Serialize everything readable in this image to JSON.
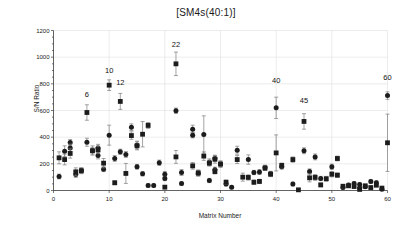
{
  "chart_data": {
    "type": "scatter",
    "title": "[SM4s(40:1)]",
    "xlabel": "Matrix Number",
    "ylabel": "S/N Ratio",
    "xlim": [
      0,
      60
    ],
    "ylim": [
      0,
      1200
    ],
    "xticks": [
      0,
      10,
      20,
      30,
      40,
      50,
      60
    ],
    "yticks": [
      0,
      200,
      400,
      600,
      800,
      1000,
      1200
    ],
    "xtick_labels": [
      "0",
      "10",
      "20",
      "30",
      "40",
      "50",
      "60"
    ],
    "ytick_labels": [
      "0",
      "200",
      "400",
      "600",
      "800",
      "1000",
      "1200"
    ],
    "grid": "both-major",
    "legend": "none",
    "annotations": [
      {
        "text": "6",
        "x": 6,
        "y": 700
      },
      {
        "text": "10",
        "x": 10,
        "y": 880
      },
      {
        "text": "12",
        "x": 12,
        "y": 790
      },
      {
        "text": "22",
        "x": 22,
        "y": 1080
      },
      {
        "text": "40",
        "x": 40,
        "y": 810
      },
      {
        "text": "45",
        "x": 45,
        "y": 660
      },
      {
        "text": "60",
        "x": 60,
        "y": 830
      }
    ],
    "series": [
      {
        "name": "circles",
        "marker": "circle",
        "color": "#1c1c1c",
        "points": [
          {
            "x": 1,
            "y": 105,
            "err": 18
          },
          {
            "x": 2,
            "y": 295,
            "err": 40
          },
          {
            "x": 3,
            "y": 360,
            "err": 22
          },
          {
            "x": 3,
            "y": 318,
            "err": 30
          },
          {
            "x": 4,
            "y": 120,
            "err": 22
          },
          {
            "x": 5,
            "y": 150,
            "err": 20
          },
          {
            "x": 6,
            "y": 362,
            "err": 30
          },
          {
            "x": 7,
            "y": 300,
            "err": 35
          },
          {
            "x": 8,
            "y": 318,
            "err": 28
          },
          {
            "x": 8,
            "y": 262,
            "err": 25
          },
          {
            "x": 9,
            "y": 160,
            "err": 18
          },
          {
            "x": 10,
            "y": 415,
            "err": 75
          },
          {
            "x": 11,
            "y": 240,
            "err": 22
          },
          {
            "x": 12,
            "y": 290,
            "err": 20
          },
          {
            "x": 13,
            "y": 270,
            "err": 22
          },
          {
            "x": 14,
            "y": 475,
            "err": 25
          },
          {
            "x": 15,
            "y": 178,
            "err": 18
          },
          {
            "x": 15,
            "y": 340,
            "err": 30
          },
          {
            "x": 16,
            "y": 125,
            "err": 16
          },
          {
            "x": 17,
            "y": 38,
            "err": 12
          },
          {
            "x": 18,
            "y": 38,
            "err": 12
          },
          {
            "x": 19,
            "y": 208,
            "err": 20
          },
          {
            "x": 20,
            "y": 122,
            "err": 20
          },
          {
            "x": 20,
            "y": 90,
            "err": 16
          },
          {
            "x": 22,
            "y": 598,
            "err": 20
          },
          {
            "x": 23,
            "y": 135,
            "err": 22
          },
          {
            "x": 23,
            "y": 52,
            "err": 12
          },
          {
            "x": 25,
            "y": 460,
            "err": 30
          },
          {
            "x": 25,
            "y": 415,
            "err": 20
          },
          {
            "x": 26,
            "y": 128,
            "err": 20
          },
          {
            "x": 27,
            "y": 420,
            "err": 140
          },
          {
            "x": 28,
            "y": 212,
            "err": 25
          },
          {
            "x": 28,
            "y": 75,
            "err": 16
          },
          {
            "x": 29,
            "y": 240,
            "err": 22
          },
          {
            "x": 29,
            "y": 155,
            "err": 20
          },
          {
            "x": 30,
            "y": 198,
            "err": 20
          },
          {
            "x": 31,
            "y": 48,
            "err": 14
          },
          {
            "x": 32,
            "y": 25,
            "err": 12
          },
          {
            "x": 33,
            "y": 302,
            "err": 30
          },
          {
            "x": 35,
            "y": 232,
            "err": 35
          },
          {
            "x": 36,
            "y": 135,
            "err": 16
          },
          {
            "x": 37,
            "y": 138,
            "err": 18
          },
          {
            "x": 38,
            "y": 172,
            "err": 18
          },
          {
            "x": 39,
            "y": 128,
            "err": 16
          },
          {
            "x": 40,
            "y": 620,
            "err": 80
          },
          {
            "x": 41,
            "y": 178,
            "err": 18
          },
          {
            "x": 43,
            "y": 48,
            "err": 14
          },
          {
            "x": 45,
            "y": 298,
            "err": 22
          },
          {
            "x": 46,
            "y": 142,
            "err": 20
          },
          {
            "x": 47,
            "y": 252,
            "err": 22
          },
          {
            "x": 48,
            "y": 90,
            "err": 16
          },
          {
            "x": 50,
            "y": 178,
            "err": 20
          },
          {
            "x": 52,
            "y": 22,
            "err": 10
          },
          {
            "x": 53,
            "y": 42,
            "err": 12
          },
          {
            "x": 54,
            "y": 52,
            "err": 14
          },
          {
            "x": 55,
            "y": 45,
            "err": 14
          },
          {
            "x": 55,
            "y": 18,
            "err": 10
          },
          {
            "x": 56,
            "y": 28,
            "err": 12
          },
          {
            "x": 57,
            "y": 68,
            "err": 14
          },
          {
            "x": 58,
            "y": 58,
            "err": 14
          },
          {
            "x": 59,
            "y": 10,
            "err": 8
          },
          {
            "x": 60,
            "y": 712,
            "err": 28
          }
        ]
      },
      {
        "name": "squares",
        "marker": "square",
        "color": "#1c1c1c",
        "points": [
          {
            "x": 1,
            "y": 245,
            "err": 45
          },
          {
            "x": 2,
            "y": 232,
            "err": 40
          },
          {
            "x": 3,
            "y": 278,
            "err": 35
          },
          {
            "x": 4,
            "y": 140,
            "err": 30
          },
          {
            "x": 5,
            "y": 148,
            "err": 22
          },
          {
            "x": 6,
            "y": 585,
            "err": 58
          },
          {
            "x": 7,
            "y": 298,
            "err": 25
          },
          {
            "x": 8,
            "y": 305,
            "err": 28
          },
          {
            "x": 9,
            "y": 205,
            "err": 35
          },
          {
            "x": 10,
            "y": 790,
            "err": 40
          },
          {
            "x": 11,
            "y": 58,
            "err": 14
          },
          {
            "x": 12,
            "y": 668,
            "err": 60
          },
          {
            "x": 13,
            "y": 128,
            "err": 75
          },
          {
            "x": 14,
            "y": 412,
            "err": 28
          },
          {
            "x": 15,
            "y": 335,
            "err": 30
          },
          {
            "x": 16,
            "y": 422,
            "err": 95
          },
          {
            "x": 17,
            "y": 488,
            "err": 22
          },
          {
            "x": 20,
            "y": 25,
            "err": 10
          },
          {
            "x": 22,
            "y": 950,
            "err": 88
          },
          {
            "x": 22,
            "y": 252,
            "err": 48
          },
          {
            "x": 25,
            "y": 185,
            "err": 25
          },
          {
            "x": 26,
            "y": 132,
            "err": 22
          },
          {
            "x": 27,
            "y": 258,
            "err": 32
          },
          {
            "x": 28,
            "y": 205,
            "err": 22
          },
          {
            "x": 29,
            "y": 235,
            "err": 30
          },
          {
            "x": 29,
            "y": 142,
            "err": 18
          },
          {
            "x": 30,
            "y": 198,
            "err": 25
          },
          {
            "x": 31,
            "y": 62,
            "err": 16
          },
          {
            "x": 33,
            "y": 232,
            "err": 30
          },
          {
            "x": 34,
            "y": 100,
            "err": 30
          },
          {
            "x": 35,
            "y": 98,
            "err": 20
          },
          {
            "x": 36,
            "y": 62,
            "err": 16
          },
          {
            "x": 37,
            "y": 68,
            "err": 16
          },
          {
            "x": 38,
            "y": 168,
            "err": 18
          },
          {
            "x": 39,
            "y": 122,
            "err": 18
          },
          {
            "x": 40,
            "y": 282,
            "err": 135
          },
          {
            "x": 41,
            "y": 188,
            "err": 18
          },
          {
            "x": 43,
            "y": 232,
            "err": 20
          },
          {
            "x": 44,
            "y": 5,
            "err": 8
          },
          {
            "x": 45,
            "y": 518,
            "err": 58
          },
          {
            "x": 46,
            "y": 95,
            "err": 30
          },
          {
            "x": 47,
            "y": 98,
            "err": 22
          },
          {
            "x": 48,
            "y": 42,
            "err": 14
          },
          {
            "x": 49,
            "y": 88,
            "err": 18
          },
          {
            "x": 50,
            "y": 122,
            "err": 20
          },
          {
            "x": 51,
            "y": 240,
            "err": 18
          },
          {
            "x": 51,
            "y": 115,
            "err": 16
          },
          {
            "x": 52,
            "y": 32,
            "err": 12
          },
          {
            "x": 53,
            "y": 35,
            "err": 12
          },
          {
            "x": 54,
            "y": 30,
            "err": 12
          },
          {
            "x": 55,
            "y": 8,
            "err": 8
          },
          {
            "x": 56,
            "y": 35,
            "err": 12
          },
          {
            "x": 57,
            "y": 22,
            "err": 10
          },
          {
            "x": 58,
            "y": 40,
            "err": 12
          },
          {
            "x": 59,
            "y": 18,
            "err": 10
          },
          {
            "x": 60,
            "y": 358,
            "err": 215
          }
        ]
      }
    ]
  }
}
